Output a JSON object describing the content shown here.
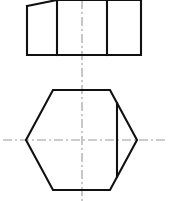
{
  "document": {
    "type": "engineering-drawing",
    "title": "Orthographic Projection",
    "description": "Two-view orthographic technical drawing: front view above, plan view below",
    "background_color": "#ffffff",
    "line_color": "#111111",
    "centerline_color": "#9a9a9a",
    "canvas": {
      "width": 169,
      "height": 201
    }
  },
  "views": {
    "front_view": {
      "name": "front-view",
      "label": "Front View",
      "shape": "rectangle-with-chamfer",
      "bounds": {
        "left": 27,
        "top": 0,
        "right": 141,
        "bottom": 55
      },
      "outline_points": "27,6 57,0 141,0 141,55 27,55 27,6",
      "chamfer": {
        "from_x": 27,
        "from_y": 6,
        "to_x": 57,
        "to_y": 0
      },
      "internal_lines": [
        {
          "name": "division-line-left",
          "x": 57,
          "y1": 0,
          "y2": 55
        },
        {
          "name": "division-line-right",
          "x": 107,
          "y1": 0,
          "y2": 55
        }
      ],
      "cropped_at_top": true
    },
    "plan_view": {
      "name": "plan-view",
      "label": "Plan View",
      "shape": "hexagon-with-chord",
      "bounds": {
        "left": 26,
        "top": 90,
        "right": 137,
        "bottom": 190
      },
      "hexagon_points": "26,140 53,90 110,90 137,140 110,190 53,190",
      "vertices": [
        {
          "name": "left-vertex",
          "x": 26,
          "y": 140
        },
        {
          "name": "top-left-vertex",
          "x": 53,
          "y": 90
        },
        {
          "name": "top-right-vertex",
          "x": 110,
          "y": 90
        },
        {
          "name": "right-vertex",
          "x": 137,
          "y": 140
        },
        {
          "name": "bottom-right-vertex",
          "x": 110,
          "y": 190
        },
        {
          "name": "bottom-left-vertex",
          "x": 53,
          "y": 190
        }
      ],
      "chord": {
        "name": "flat-cut-chord",
        "x": 117,
        "y1": 103,
        "y2": 177
      }
    }
  },
  "centerlines": {
    "vertical": {
      "name": "vertical-centerline",
      "x": 82,
      "y1": 0,
      "y2": 201
    },
    "horizontal": {
      "name": "horizontal-centerline",
      "y": 140,
      "x1": 3,
      "x2": 166
    }
  }
}
